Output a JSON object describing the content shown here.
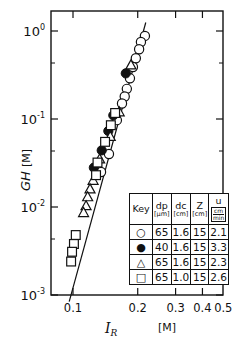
{
  "chart_data": {
    "type": "scatter",
    "title": "",
    "xlabel": "I_R [M]",
    "ylabel": "GH [M]",
    "xscale": "log",
    "yscale": "log",
    "xlim": [
      0.085,
      0.5
    ],
    "ylim": [
      0.001,
      1.5
    ],
    "x_ticks": [
      "0.1",
      "0.2",
      "0.3",
      "0.4",
      "0.5"
    ],
    "x_tick_values": [
      0.1,
      0.2,
      0.3,
      0.4,
      0.5
    ],
    "y_ticks": [
      "10^0",
      "10^-1",
      "10^-2",
      "10^-3"
    ],
    "y_tick_values": [
      1,
      0.1,
      0.01,
      0.001
    ],
    "grid": false,
    "legend_position": "lower right (inset table)",
    "fit_line": {
      "x": [
        0.096,
        0.218
      ],
      "y": [
        0.00084,
        1.25
      ],
      "style": "solid"
    },
    "series": [
      {
        "name": "open circle",
        "marker": "open-circle",
        "dp_um": 65,
        "dc_cm": 1.6,
        "Z_cm": 15,
        "u_cm_min": 2.1,
        "x": [
          0.216,
          0.207,
          0.203,
          0.196,
          0.19,
          0.184,
          0.178,
          0.174,
          0.169,
          0.16,
          0.147,
          0.135
        ],
        "y": [
          0.88,
          0.75,
          0.62,
          0.49,
          0.39,
          0.29,
          0.22,
          0.18,
          0.15,
          0.097,
          0.04,
          0.025
        ]
      },
      {
        "name": "filled circle",
        "marker": "filled-circle",
        "dp_um": 40,
        "dc_cm": 1.6,
        "Z_cm": 15,
        "u_cm_min": 3.3,
        "x": [
          0.176,
          0.154,
          0.146,
          0.136,
          0.125
        ],
        "y": [
          0.33,
          0.11,
          0.073,
          0.044,
          0.028
        ]
      },
      {
        "name": "open triangle",
        "marker": "open-triangle",
        "dp_um": 65,
        "dc_cm": 1.6,
        "Z_cm": 15,
        "u_cm_min": 2.3,
        "x": [
          0.186,
          0.164,
          0.149,
          0.133,
          0.124,
          0.12,
          0.117,
          0.115,
          0.112
        ],
        "y": [
          0.41,
          0.12,
          0.063,
          0.035,
          0.02,
          0.016,
          0.013,
          0.0103,
          0.0086
        ]
      },
      {
        "name": "open square",
        "marker": "open-square",
        "dp_um": 65,
        "dc_cm": 1.0,
        "Z_cm": 15,
        "u_cm_min": 2.6,
        "x": [
          0.157,
          0.15,
          0.141,
          0.13,
          0.128,
          0.103,
          0.101,
          0.099,
          0.098
        ],
        "y": [
          0.117,
          0.085,
          0.055,
          0.032,
          0.023,
          0.0048,
          0.0038,
          0.0031,
          0.0024
        ]
      }
    ]
  },
  "axes": {
    "xlabel_main": "I",
    "xlabel_sub": "R",
    "xlabel_unit": "[M]",
    "ylabel_main": "GH",
    "ylabel_unit": "[M]",
    "x_tick_labels": [
      "0.1",
      "0.2",
      "0.3",
      "0.4",
      "0.5"
    ],
    "y_tick_base": "10",
    "y_tick_exps": [
      "0",
      "-1",
      "-2",
      "-3"
    ]
  },
  "key": {
    "header": {
      "key": "Key",
      "dp": "dp",
      "dp_unit": "[µm]",
      "dc": "dc",
      "dc_unit": "[cm]",
      "z": "Z",
      "z_unit": "[cm]",
      "u": "u",
      "u_num": "cm",
      "u_den": "min"
    },
    "rows": [
      {
        "symbol": "○",
        "dp": "65",
        "dc": "1.6",
        "z": "15",
        "u": "2.1"
      },
      {
        "symbol": "●",
        "dp": "40",
        "dc": "1.6",
        "z": "15",
        "u": "3.3"
      },
      {
        "symbol": "△",
        "dp": "65",
        "dc": "1.6",
        "z": "15",
        "u": "2.3"
      },
      {
        "symbol": "□",
        "dp": "65",
        "dc": "1.0",
        "z": "15",
        "u": "2.6"
      }
    ]
  }
}
